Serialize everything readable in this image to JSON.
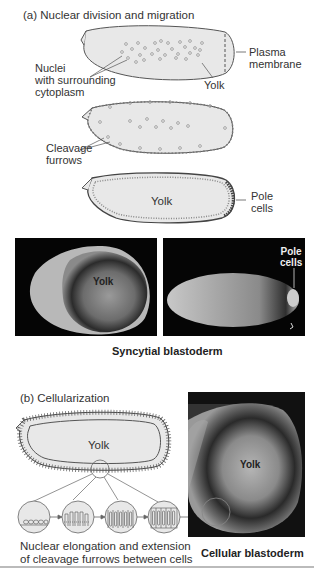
{
  "panel_a": {
    "title": "(a) Nuclear division and migration",
    "stage1": {
      "labels": {
        "nuclei": [
          "Nuclei",
          "with surrounding",
          "cytoplasm"
        ],
        "plasma_membrane": [
          "Plasma",
          "membrane"
        ],
        "yolk": "Yolk"
      }
    },
    "stage2": {
      "labels": {
        "cleavage_furrows": [
          "Cleavage",
          "furrows"
        ]
      }
    },
    "stage3": {
      "labels": {
        "yolk": "Yolk",
        "pole_cells": [
          "Pole",
          "cells"
        ]
      }
    },
    "micrographs": {
      "left": {
        "label": "Yolk"
      },
      "right": {
        "label": [
          "Pole",
          "cells"
        ]
      },
      "caption": "Syncytial blastoderm"
    }
  },
  "panel_b": {
    "title": "(b) Cellularization",
    "embryo_label": "Yolk",
    "sequence_caption": [
      "Nuclear elongation and extension",
      "of cleavage furrows between cells"
    ],
    "micrograph": {
      "label": "Yolk",
      "caption": "Cellular blastoderm"
    }
  },
  "colors": {
    "embryo_fill": "#e8e8e8",
    "outline": "#555555",
    "nucleus": "#999999",
    "photo_bg": "#050505"
  }
}
